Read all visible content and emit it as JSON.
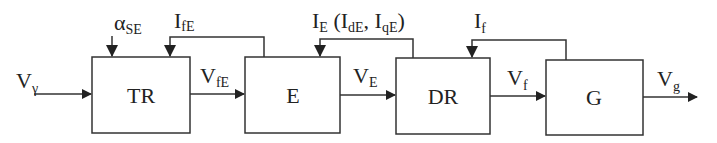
{
  "diagram": {
    "type": "block-diagram",
    "colors": {
      "stroke": "#333333",
      "text": "#222222",
      "background": "#ffffff"
    },
    "blocks": [
      {
        "id": "TR",
        "label": "TR"
      },
      {
        "id": "E",
        "label": "E"
      },
      {
        "id": "DR",
        "label": "DR"
      },
      {
        "id": "G",
        "label": "G"
      }
    ],
    "signals": {
      "input": {
        "main": "V",
        "sub": "γ"
      },
      "alpha": {
        "main": "α",
        "sub": "SE"
      },
      "ife": {
        "main": "I",
        "sub": "fE"
      },
      "vfe": {
        "main": "V",
        "sub": "fE"
      },
      "ie": {
        "main": "I",
        "sub": "E",
        "paren_open": " (I",
        "sub2": "dE",
        "mid": ", I",
        "sub3": "qE",
        "paren_close": ")"
      },
      "ve": {
        "main": "V",
        "sub": "E"
      },
      "if": {
        "main": "I",
        "sub": "f"
      },
      "vf": {
        "main": "V",
        "sub": "f"
      },
      "vg": {
        "main": "V",
        "sub": "g"
      }
    }
  }
}
